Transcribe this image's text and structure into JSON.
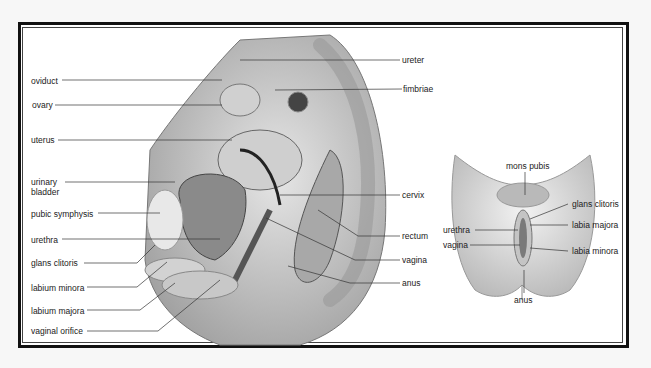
{
  "diagram": {
    "type": "anatomy-illustration",
    "panels": [
      {
        "name": "sagittal-section",
        "labels_left": [
          {
            "text": "oviduct"
          },
          {
            "text": "ovary"
          },
          {
            "text": "uterus"
          },
          {
            "text": "urinary bladder"
          },
          {
            "text": "pubic symphysis"
          },
          {
            "text": "urethra"
          },
          {
            "text": "glans clitoris"
          },
          {
            "text": "labium minora"
          },
          {
            "text": "labium majora"
          },
          {
            "text": "vaginal orifice"
          }
        ],
        "labels_right": [
          {
            "text": "ureter"
          },
          {
            "text": "fimbriae"
          },
          {
            "text": "cervix"
          },
          {
            "text": "rectum"
          },
          {
            "text": "vagina"
          },
          {
            "text": "anus"
          }
        ]
      },
      {
        "name": "external-view",
        "labels": [
          {
            "text": "mons pubis"
          },
          {
            "text": "glans clitoris"
          },
          {
            "text": "labia majora"
          },
          {
            "text": "urethra"
          },
          {
            "text": "vagina"
          },
          {
            "text": "labia minora"
          },
          {
            "text": "anus"
          }
        ]
      }
    ]
  },
  "labels": {
    "oviduct": "oviduct",
    "ovary": "ovary",
    "uterus": "uterus",
    "urinary": "urinary",
    "bladder": "bladder",
    "pubic_symphysis": "pubic symphysis",
    "urethra": "urethra",
    "glans_clitoris": "glans clitoris",
    "labium_minora": "labium minora",
    "labium_majora": "labium majora",
    "vaginal_orifice": "vaginal orifice",
    "ureter": "ureter",
    "fimbriae": "fimbriae",
    "cervix": "cervix",
    "rectum": "rectum",
    "vagina": "vagina",
    "anus": "anus",
    "ext_mons_pubis": "mons pubis",
    "ext_glans_clitoris": "glans clitoris",
    "ext_labia_majora": "labia majora",
    "ext_urethra": "urethra",
    "ext_vagina": "vagina",
    "ext_labia_minora": "labia minora",
    "ext_anus": "anus"
  },
  "colors": {
    "frame": "#111111",
    "background": "#ffffff",
    "tissue_light": "#d8d8d8",
    "tissue_mid": "#b0b0b0",
    "tissue_dark": "#555555"
  }
}
